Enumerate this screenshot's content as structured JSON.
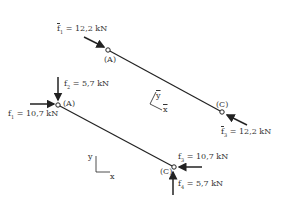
{
  "top_member": {
    "node_a": "(A)",
    "node_c": "(C)",
    "force_1": {
      "symbol": "f",
      "sub": "1",
      "value": "= 12,2 kN"
    },
    "force_3": {
      "symbol": "f",
      "sub": "3",
      "value": "= 12,2 kN"
    },
    "axes": {
      "x": "x",
      "y": "y"
    }
  },
  "bottom_member": {
    "node_a": "(A)",
    "node_c": "(C)",
    "force_1": {
      "symbol": "f",
      "sub": "1",
      "value": "= 10,7 kN"
    },
    "force_2": {
      "symbol": "f",
      "sub": "2",
      "value": "= 5,7 kN"
    },
    "force_3": {
      "symbol": "f",
      "sub": "3",
      "value": "= 10,7 kN"
    },
    "force_4": {
      "symbol": "f",
      "sub": "4",
      "value": "= 5,7 kN"
    },
    "axes": {
      "x": "x",
      "y": "y"
    }
  },
  "colors": {
    "line": "#222222",
    "text": "#333333"
  }
}
